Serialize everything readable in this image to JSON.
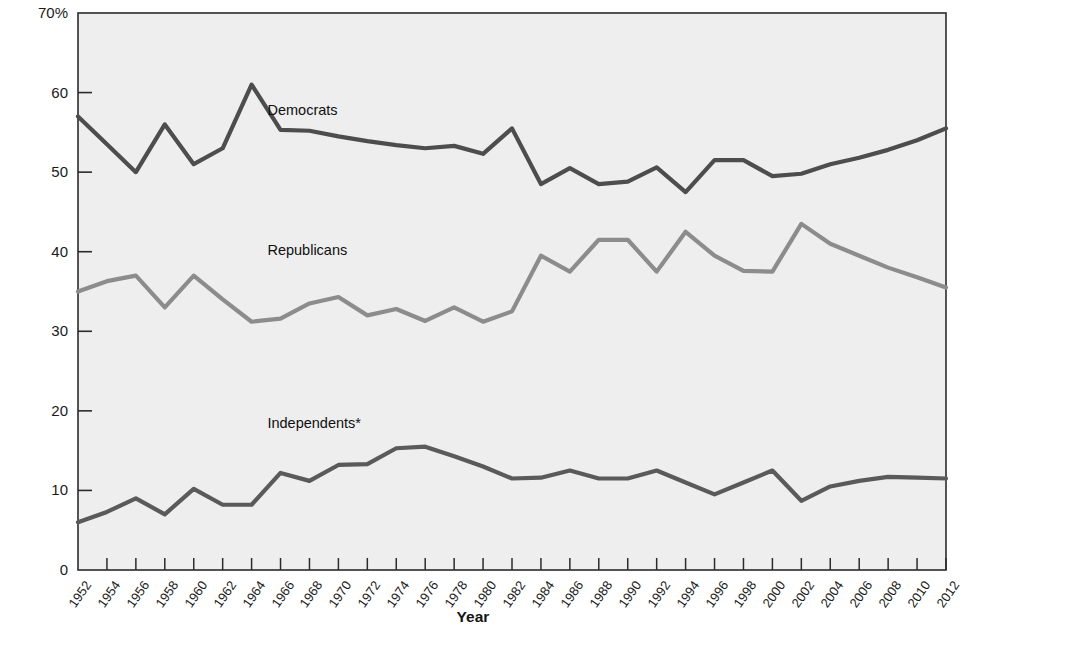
{
  "chart_data": {
    "type": "line",
    "title": "",
    "xlabel": "Year",
    "ylabel": "Percent of Respondents Identifying with Party",
    "ylim": [
      0,
      70
    ],
    "xlim": [
      1952,
      2012
    ],
    "yticks": [
      "0",
      "10",
      "20",
      "30",
      "40",
      "50",
      "60",
      "70%"
    ],
    "ytick_values": [
      0,
      10,
      20,
      30,
      40,
      50,
      60,
      70
    ],
    "grid": false,
    "legend_position": "inline-annotations",
    "plot_background": "#eeeeee",
    "x": [
      1952,
      1954,
      1956,
      1958,
      1960,
      1962,
      1964,
      1966,
      1968,
      1970,
      1972,
      1974,
      1976,
      1978,
      1980,
      1982,
      1984,
      1986,
      1988,
      1990,
      1992,
      1994,
      1996,
      1998,
      2000,
      2002,
      2004,
      2006,
      2008,
      2010,
      2012
    ],
    "categories": [
      "1952",
      "1954",
      "1956",
      "1958",
      "1960",
      "1962",
      "1964",
      "1966",
      "1968",
      "1970",
      "1972",
      "1974",
      "1976",
      "1978",
      "1980",
      "1982",
      "1984",
      "1986",
      "1988",
      "1990",
      "1992",
      "1994",
      "1996",
      "1998",
      "2000",
      "2002",
      "2004",
      "2006",
      "2008",
      "2010",
      "2012"
    ],
    "series": [
      {
        "name": "Democrats",
        "color": "#4d4d4d",
        "label_x": 1968,
        "label_y": 57.6,
        "values": [
          57.0,
          53.5,
          50.0,
          56.0,
          51.0,
          53.0,
          61.0,
          55.3,
          55.2,
          54.5,
          53.9,
          53.4,
          53.0,
          53.3,
          52.3,
          55.5,
          48.5,
          50.5,
          48.5,
          48.8,
          50.6,
          47.5,
          51.5,
          51.5,
          49.5,
          49.8,
          51.0,
          51.8,
          52.8,
          54.0,
          55.5
        ]
      },
      {
        "name": "Republicans",
        "color": "#8c8c8c",
        "label_x": 1968,
        "label_y": 40.0,
        "values": [
          35.0,
          36.3,
          37.0,
          33.0,
          37.0,
          34.0,
          31.2,
          31.6,
          33.5,
          34.3,
          32.0,
          32.8,
          31.3,
          33.0,
          31.2,
          32.5,
          39.5,
          37.5,
          41.5,
          41.5,
          37.5,
          42.5,
          39.5,
          37.6,
          37.5,
          43.5,
          41.0,
          39.5,
          38.0,
          36.8,
          35.5
        ]
      },
      {
        "name": "Independents*",
        "color": "#5a5a5a",
        "label_x": 1968,
        "label_y": 18.2,
        "values": [
          6.0,
          7.3,
          9.0,
          7.0,
          10.2,
          8.2,
          8.2,
          12.2,
          11.2,
          13.2,
          13.3,
          15.3,
          15.5,
          14.3,
          13.0,
          11.5,
          11.6,
          12.5,
          11.5,
          11.5,
          12.5,
          11.0,
          9.5,
          11.0,
          12.5,
          8.7,
          10.5,
          11.2,
          11.7,
          11.6,
          11.5
        ]
      }
    ],
    "footnote_marker": "*"
  }
}
